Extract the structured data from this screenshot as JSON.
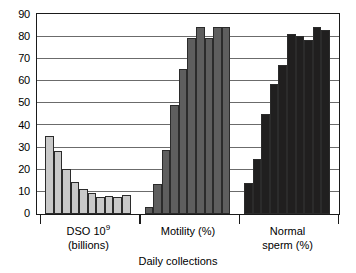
{
  "chart_data": {
    "type": "bar",
    "title": "",
    "xlabel": "Daily collections",
    "ylabel": "",
    "ylim": [
      0,
      90
    ],
    "ytick_step": 10,
    "yticks": [
      90,
      80,
      70,
      60,
      50,
      40,
      30,
      20,
      10,
      0
    ],
    "grid": true,
    "legend": "none",
    "groups": [
      {
        "name": "DSO 10⁹ (billions)",
        "label_line1": "DSO 10",
        "label_sup": "9",
        "label_line2": "(billions)",
        "color": "#c9c9c9",
        "values": [
          35.5,
          28.5,
          20.5,
          14.5,
          11.5,
          9.5,
          7.5,
          8.0,
          7.5,
          8.5
        ]
      },
      {
        "name": "Motility (%)",
        "label_line1": "Motility (%)",
        "label_sup": "",
        "label_line2": "",
        "color": "#5e5e5e",
        "values": [
          3.0,
          13.5,
          29.0,
          49.5,
          65.5,
          79.5,
          84.5,
          79.5,
          84.5,
          84.5
        ]
      },
      {
        "name": "Normal sperm (%)",
        "label_line1": "Normal",
        "label_sup": "",
        "label_line2": "sperm (%)",
        "color": "#201f1f",
        "values": [
          14.0,
          25.0,
          45.5,
          59.0,
          67.5,
          81.5,
          80.5,
          79.0,
          84.5,
          83.5
        ]
      }
    ]
  },
  "axis": {
    "x_title": "Daily collections"
  },
  "colors": {
    "frame": "#1a1a1a",
    "gridline": "#6b6b6b",
    "background": "#ffffff"
  }
}
